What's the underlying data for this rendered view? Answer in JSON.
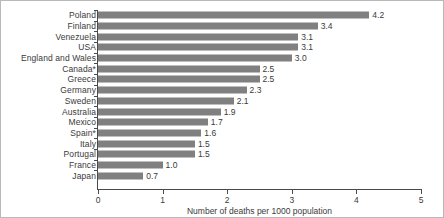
{
  "chart_data": {
    "type": "bar",
    "orientation": "horizontal",
    "title": "",
    "xlabel": "Number of deaths per 1000 population",
    "ylabel": "",
    "xlim": [
      0,
      5
    ],
    "xticks": [
      "0",
      "1",
      "2",
      "3",
      "4",
      "5"
    ],
    "grid": false,
    "legend": false,
    "bar_color": "#808080",
    "categories": [
      "Poland",
      "Finland",
      "Venezuela",
      "USA",
      "England and Wales",
      "Canada*",
      "Greece",
      "Germany",
      "Sweden",
      "Australia",
      "Mexico",
      "Spain*",
      "Italy",
      "Portugal",
      "France",
      "Japan"
    ],
    "values": [
      4.2,
      3.4,
      3.1,
      3.1,
      3.0,
      2.5,
      2.5,
      2.3,
      2.1,
      1.9,
      1.7,
      1.6,
      1.5,
      1.5,
      1.0,
      0.7
    ],
    "data_labels": [
      "4.2",
      "3.4",
      "3.1",
      "3.1",
      "3.0",
      "2.5",
      "2.5",
      "2.3",
      "2.1",
      "1.9",
      "1.7",
      "1.6",
      "1.5",
      "1.5",
      "1.0",
      "0.7"
    ]
  }
}
